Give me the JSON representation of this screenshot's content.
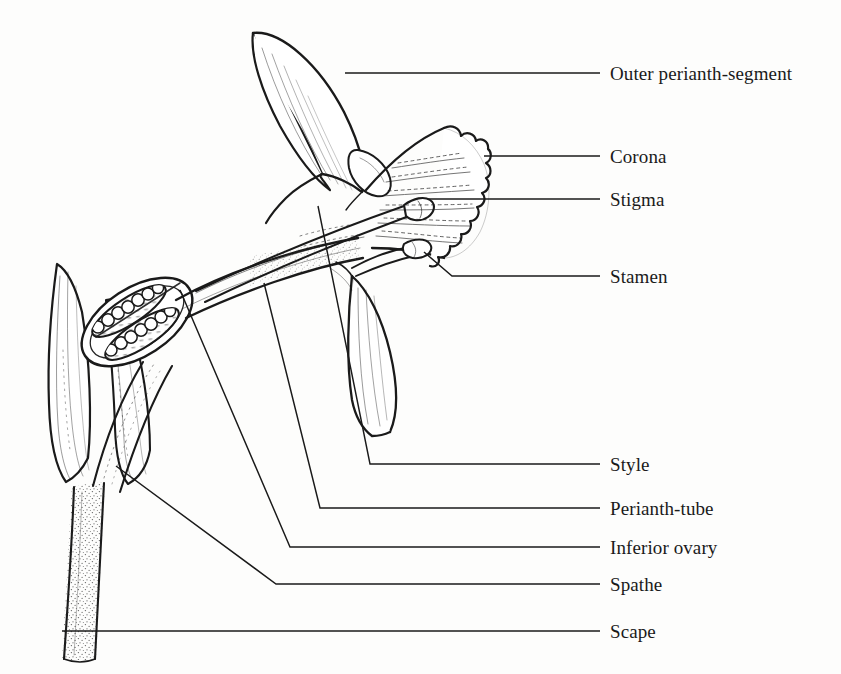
{
  "diagram": {
    "background_color": "#fdfdfc",
    "ink_color": "#1a1a1a",
    "labels": [
      {
        "id": "outer-perianth-segment",
        "text": "Outer perianth-segment",
        "text_x": 610,
        "text_y": 73,
        "leader": "M 600 73 L 345 73 L 345 73",
        "tick_from_x": 600,
        "tick_to_x": 586
      },
      {
        "id": "corona",
        "text": "Corona",
        "text_x": 610,
        "text_y": 156,
        "leader": "M 600 156 L 484 156",
        "tick_from_x": 600,
        "tick_to_x": 586
      },
      {
        "id": "stigma",
        "text": "Stigma",
        "text_x": 610,
        "text_y": 199,
        "leader": "M 600 199 L 428 199",
        "tick_from_x": 600,
        "tick_to_x": 586
      },
      {
        "id": "stamen",
        "text": "Stamen",
        "text_x": 610,
        "text_y": 276,
        "leader": "M 600 276 L 452 276 L 424 252",
        "tick_from_x": 600,
        "tick_to_x": 586
      },
      {
        "id": "style",
        "text": "Style",
        "text_x": 610,
        "text_y": 464,
        "leader": "M 600 464 L 370 464 L 318 206",
        "tick_from_x": 600,
        "tick_to_x": 586
      },
      {
        "id": "perianth-tube",
        "text": "Perianth-tube",
        "text_x": 610,
        "text_y": 508,
        "leader": "M 600 508 L 320 508 L 264 283",
        "tick_from_x": 600,
        "tick_to_x": 586
      },
      {
        "id": "inferior-ovary",
        "text": "Inferior ovary",
        "text_x": 610,
        "text_y": 547,
        "leader": "M 600 547 L 290 547 L 180 290",
        "tick_from_x": 600,
        "tick_to_x": 586
      },
      {
        "id": "spathe",
        "text": "Spathe",
        "text_x": 610,
        "text_y": 584,
        "leader": "M 600 584 L 276 584 L 116 466",
        "tick_from_x": 600,
        "tick_to_x": 586
      },
      {
        "id": "scape",
        "text": "Scape",
        "text_x": 610,
        "text_y": 631,
        "leader": "M 600 631 L 62 631",
        "tick_from_x": 600,
        "tick_to_x": 586
      }
    ],
    "parts": [
      {
        "id": "outer-perianth-segment-upper",
        "name": "Outer perianth-segment (upper tepal)"
      },
      {
        "id": "outer-perianth-segment-lower",
        "name": "Perianth segment (lower tepal)"
      },
      {
        "id": "corona-trumpet",
        "name": "Corona (frilled trumpet)"
      },
      {
        "id": "stigma-knob",
        "name": "Stigma"
      },
      {
        "id": "style-filament",
        "name": "Style"
      },
      {
        "id": "stamen-anther",
        "name": "Stamen with anther"
      },
      {
        "id": "perianth-tube-body",
        "name": "Perianth-tube"
      },
      {
        "id": "inferior-ovary-body",
        "name": "Inferior ovary with ovules"
      },
      {
        "id": "spathe-bracts",
        "name": "Spathe bracts"
      },
      {
        "id": "scape-stem",
        "name": "Scape"
      }
    ]
  }
}
